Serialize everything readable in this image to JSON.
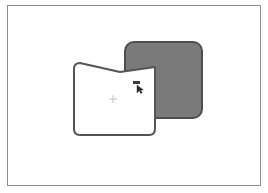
{
  "document": {
    "title": "Vector shape drawing",
    "canvas_width": 268,
    "canvas_height": 193,
    "background_color": "#ffffff"
  },
  "page_frame": {
    "name": "page-border",
    "border_color": "#8d8d8d",
    "x": 7,
    "y": 5,
    "width": 254,
    "height": 181
  },
  "shapes": [
    {
      "id": "gray-rounded-rectangle",
      "label": "Rounded rectangle",
      "fill_color": "#7a7a7a",
      "stroke_color": "#4f4f4f",
      "stroke_width": 2,
      "corner_radius": 9,
      "x": 124,
      "y": 41,
      "width": 79,
      "height": 78,
      "z_order": 1
    },
    {
      "id": "white-folder-shape",
      "label": "Notched panel",
      "fill_color": "#ffffff",
      "stroke_color": "#555555",
      "stroke_width": 2,
      "corner_radius": 6,
      "x": 73,
      "y": 61,
      "width": 83,
      "height": 75,
      "notch_apex_x": 120,
      "notch_apex_y": 72,
      "z_order": 2
    }
  ],
  "annotations": {
    "selection_label": "▬",
    "cursor_icon": "mouse-pointer-icon",
    "cursor_x": 138,
    "cursor_y": 86,
    "anchor_marker": "+",
    "anchor_x": 113,
    "anchor_y": 99
  },
  "colors": {
    "gray_fill": "#7a7a7a",
    "dark_stroke": "#4f4f4f",
    "panel_stroke": "#555555",
    "frame": "#8d8d8d",
    "white": "#ffffff"
  }
}
